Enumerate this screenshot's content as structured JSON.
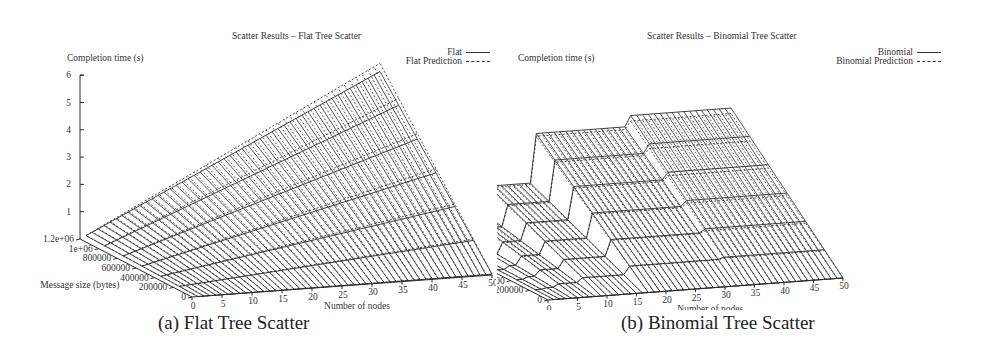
{
  "figures": [
    {
      "id": "a",
      "title": "Scatter Results – Flat Tree Scatter",
      "caption": "(a) Flat Tree Scatter",
      "zlabel": "Completion time (s)",
      "xlabel": "Number of nodes",
      "ylabel": "Message size (bytes)",
      "legend": [
        {
          "label": "Flat",
          "style": "solid"
        },
        {
          "label": "Flat Prediction",
          "style": "dashed"
        }
      ],
      "z_ticks": [
        "1",
        "2",
        "3",
        "4",
        "5",
        "6"
      ],
      "x_ticks": [
        "0",
        "5",
        "10",
        "15",
        "20",
        "25",
        "30",
        "35",
        "40",
        "45",
        "50"
      ],
      "y_ticks": [
        "0",
        "200000",
        "400000",
        "600000",
        "800000",
        "1e+06",
        "1.2e+06"
      ]
    },
    {
      "id": "b",
      "title": "Scatter Results – Binomial Tree Scatter",
      "caption": "(b) Binomial Tree Scatter",
      "zlabel": "Completion time (s)",
      "xlabel": "Number of nodes",
      "ylabel": "Message size (bytes)",
      "legend": [
        {
          "label": "Binomial",
          "style": "solid"
        },
        {
          "label": "Binomial Prediction",
          "style": "dashed"
        }
      ],
      "z_ticks": [
        "1",
        "2",
        "3",
        "4",
        "5",
        "6"
      ],
      "x_ticks": [
        "0",
        "5",
        "10",
        "15",
        "20",
        "25",
        "30",
        "35",
        "40",
        "45",
        "50"
      ],
      "y_ticks": [
        "0",
        "200000",
        "400000",
        "600000",
        "800000",
        "1e+06",
        "1.2e+06"
      ]
    }
  ],
  "chart_data": [
    {
      "type": "surface3d",
      "title": "Scatter Results – Flat Tree Scatter",
      "xlabel": "Number of nodes",
      "ylabel": "Message size (bytes)",
      "zlabel": "Completion time (s)",
      "xlim": [
        0,
        50
      ],
      "ylim": [
        0,
        1200000
      ],
      "zlim": [
        0,
        6
      ],
      "series": [
        {
          "name": "Flat",
          "style": "solid",
          "model": "time grows linearly with nodes and message size",
          "corner_values": {
            "x0_y0": 0.0,
            "x50_y0": 0.05,
            "x0_y1.2e6": 0.0,
            "x50_y1.2e6": 5.3
          }
        },
        {
          "name": "Flat Prediction",
          "style": "dashed",
          "model": "linear prediction slightly above measured",
          "corner_values": {
            "x0_y0": 0.0,
            "x50_y0": 0.05,
            "x0_y1.2e6": 0.0,
            "x50_y1.2e6": 5.6
          }
        }
      ],
      "grid": false,
      "legend_position": "top-right"
    },
    {
      "type": "surface3d",
      "title": "Scatter Results – Binomial Tree Scatter",
      "xlabel": "Number of nodes",
      "ylabel": "Message size (bytes)",
      "zlabel": "Completion time (s)",
      "xlim": [
        0,
        50
      ],
      "ylim": [
        0,
        1200000
      ],
      "zlim": [
        0,
        6
      ],
      "series": [
        {
          "name": "Binomial",
          "style": "solid",
          "model": "step function in log2(nodes), linear in message size",
          "steps_at_max_message_size": [
            {
              "nodes": [
                1,
                2
              ],
              "time": 0.05
            },
            {
              "nodes": [
                3,
                4
              ],
              "time": 0.3
            },
            {
              "nodes": [
                5,
                8
              ],
              "time": 0.95
            },
            {
              "nodes": [
                9,
                16
              ],
              "time": 1.9
            },
            {
              "nodes": [
                17,
                32
              ],
              "time": 3.7
            },
            {
              "nodes": [
                33,
                50
              ],
              "time": 4.1
            }
          ]
        },
        {
          "name": "Binomial Prediction",
          "style": "dashed",
          "model": "step prediction close to measured",
          "steps_at_max_message_size": [
            {
              "nodes": [
                1,
                2
              ],
              "time": 0.05
            },
            {
              "nodes": [
                3,
                4
              ],
              "time": 0.3
            },
            {
              "nodes": [
                5,
                8
              ],
              "time": 0.9
            },
            {
              "nodes": [
                9,
                16
              ],
              "time": 1.85
            },
            {
              "nodes": [
                17,
                32
              ],
              "time": 3.6
            },
            {
              "nodes": [
                33,
                50
              ],
              "time": 3.9
            }
          ]
        }
      ],
      "grid": false,
      "legend_position": "top-right"
    }
  ]
}
